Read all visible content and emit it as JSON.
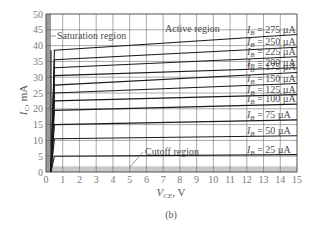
{
  "chart_data": {
    "type": "line",
    "title": "",
    "caption": "(b)",
    "xlabel": "V_CE, V",
    "xlabel_main": "V",
    "xlabel_sub": "CE",
    "xlabel_unit": ", V",
    "ylabel": "I_C, mA",
    "ylabel_main": "I",
    "ylabel_sub": "C",
    "ylabel_unit": ", mA",
    "xlim": [
      0,
      15
    ],
    "ylim": [
      0,
      50
    ],
    "xticks": [
      0,
      1,
      2,
      3,
      4,
      5,
      6,
      7,
      8,
      9,
      10,
      11,
      12,
      13,
      14,
      15
    ],
    "yticks": [
      0,
      5,
      10,
      15,
      20,
      25,
      30,
      35,
      40,
      45,
      50
    ],
    "grid": true,
    "regions": {
      "saturation": {
        "label": "Saturation region",
        "x_range": [
          0,
          0.3
        ],
        "color": "#9a9a9a"
      },
      "cutoff": {
        "label": "Cutoff region",
        "y_range": [
          0,
          1.8
        ],
        "color": "#c8c8c8"
      },
      "active": {
        "label": "Active region"
      }
    },
    "series": [
      {
        "name": "I_B = 275 µA",
        "label": "275 µA",
        "x": [
          0.3,
          0.5,
          15
        ],
        "values": [
          0,
          38.5,
          43.5
        ]
      },
      {
        "name": "I_B = 250 µA",
        "label": "250 µA",
        "x": [
          0.3,
          0.5,
          15
        ],
        "values": [
          0,
          35.5,
          39.5
        ]
      },
      {
        "name": "I_B = 225 µA",
        "label": "225 µA",
        "x": [
          0.3,
          0.5,
          15
        ],
        "values": [
          0,
          33,
          36.5
        ]
      },
      {
        "name": "I_B = 200 µA",
        "label": "200 µA",
        "x": [
          0.3,
          0.5,
          15
        ],
        "values": [
          0,
          30.5,
          33
        ]
      },
      {
        "name": "I_B = 175 µA",
        "label": "175 µA",
        "x": [
          0.3,
          0.5,
          15
        ],
        "values": [
          0,
          27.5,
          31.5
        ]
      },
      {
        "name": "I_B = 150 µA",
        "label": "150 µA",
        "x": [
          0.3,
          0.5,
          15
        ],
        "values": [
          0,
          25,
          28
        ]
      },
      {
        "name": "I_B = 125 µA",
        "label": "125 µA",
        "x": [
          0.3,
          0.5,
          15
        ],
        "values": [
          0,
          22.5,
          24.5
        ]
      },
      {
        "name": "I_B = 100 µA",
        "label": "100 µA",
        "x": [
          0.3,
          0.5,
          15
        ],
        "values": [
          0,
          19.5,
          21.5
        ]
      },
      {
        "name": "I_B = 75 µA",
        "label": "75 µA",
        "x": [
          0.3,
          0.5,
          15
        ],
        "values": [
          0,
          15,
          16.5
        ]
      },
      {
        "name": "I_B = 50 µA",
        "label": "50 µA",
        "x": [
          0.3,
          0.5,
          15
        ],
        "values": [
          0,
          10.5,
          11.5
        ]
      },
      {
        "name": "I_B = 25 µA",
        "label": "25 µA",
        "x": [
          0.3,
          0.5,
          15
        ],
        "values": [
          0,
          5,
          5.5
        ]
      }
    ],
    "label_prefix_main": "I",
    "label_prefix_sub": "B",
    "label_eq": " = ",
    "colors": {
      "curve": "#1a1a1a",
      "grid": "#555555",
      "frame": "#555555",
      "saturation_band": "#9a9a9a",
      "cutoff_band": "#c8c8c8"
    }
  }
}
